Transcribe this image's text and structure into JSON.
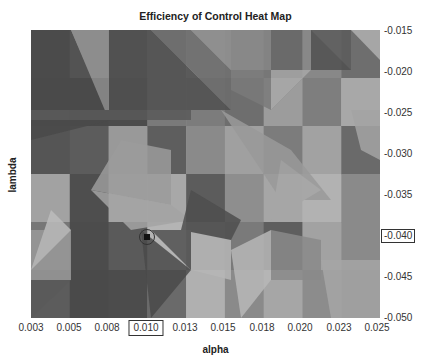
{
  "chart_data": {
    "type": "heatmap",
    "title": "Efficiency of Control Heat Map",
    "xlabel": "alpha",
    "ylabel": "lambda",
    "x_ticks": [
      "0.003",
      "0.005",
      "0.008",
      "0.010",
      "0.013",
      "0.015",
      "0.018",
      "0.020",
      "0.023",
      "0.025"
    ],
    "y_ticks": [
      "-0.015",
      "-0.020",
      "-0.025",
      "-0.030",
      "-0.035",
      "-0.040",
      "-0.045",
      "-0.050"
    ],
    "xlim": [
      0.003,
      0.025
    ],
    "ylim": [
      -0.05,
      -0.015
    ],
    "colormap": "grayscale",
    "highlighted_x_tick": "0.010",
    "highlighted_y_tick": "-0.040",
    "marker": {
      "x": 0.01,
      "y": -0.04,
      "shape": "circled square"
    },
    "grid_rows": 6,
    "grid_cols": 9,
    "cell_shades": [
      [
        "#555",
        "#8a8a8a",
        "#5a5a5a",
        "#7e7e7e",
        "#9a9a9a",
        "#8c8c8c",
        "#6a6a6a",
        "#888",
        "#6e6e6e"
      ],
      [
        "#4e4e4e",
        "#4a4a4a",
        "#4c4c4c",
        "#7a7a7a",
        "#7c7c7c",
        "#6e6e6e",
        "#9c9c9c",
        "#7e7e7e",
        "#a8a8a8"
      ],
      [
        "#555",
        "#5c5c5c",
        "#999",
        "#5e5e5e",
        "#8a8a8a",
        "#a0a0a0",
        "#7c7c7c",
        "#a2a2a2",
        "#6a6a6a"
      ],
      [
        "#a2a2a2",
        "#4e4e4e",
        "#a4a4a4",
        "#a8a8a8",
        "#5c5c5c",
        "#8e8e8e",
        "#a6a6a6",
        "#b2b2b2",
        "#8a8a8a"
      ],
      [
        "#777",
        "#4c4c4c",
        "#5a5a5a",
        "#b4b4b4",
        "#888",
        "#7a7a7a",
        "#5e5e5e",
        "#a2a2a2",
        "#8a8a8a"
      ],
      [
        "#5c5c5c",
        "#4a4a4a",
        "#4c4c4c",
        "#6a6a6a",
        "#b0b0b0",
        "#8a8a8a",
        "#a6a6a6",
        "#8c8c8c",
        "#7a7a7a"
      ]
    ]
  },
  "labels": {
    "title": "Efficiency of Control Heat Map",
    "xlabel": "alpha",
    "ylabel": "lambda"
  },
  "x_ticks": [
    "0.003",
    "0.005",
    "0.008",
    "0.010",
    "0.013",
    "0.015",
    "0.018",
    "0.020",
    "0.023",
    "0.025"
  ],
  "y_ticks": [
    "-0.015",
    "-0.020",
    "-0.025",
    "-0.030",
    "-0.035",
    "-0.040",
    "-0.045",
    "-0.050"
  ]
}
